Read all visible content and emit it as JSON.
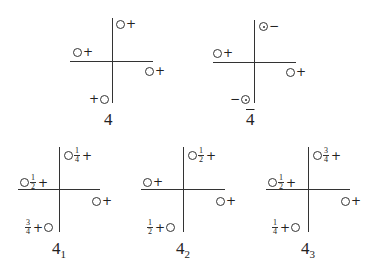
{
  "figure": {
    "panels": [
      {
        "id": "4",
        "label": "4",
        "label_sub": "",
        "overbar": false,
        "marks": [
          {
            "quadrant": "upper-right",
            "circle": "open",
            "sign": "+",
            "fraction": "",
            "order": "circle-first"
          },
          {
            "quadrant": "upper-left",
            "circle": "open",
            "sign": "+",
            "fraction": "",
            "order": "circle-first"
          },
          {
            "quadrant": "lower-right",
            "circle": "open",
            "sign": "+",
            "fraction": "",
            "order": "circle-first"
          },
          {
            "quadrant": "lower-left",
            "circle": "open",
            "sign": "+",
            "fraction": "",
            "order": "sign-first"
          }
        ]
      },
      {
        "id": "4bar",
        "label": "4",
        "label_sub": "",
        "overbar": true,
        "marks": [
          {
            "quadrant": "upper-right",
            "circle": "dotted",
            "sign": "−",
            "fraction": "",
            "order": "circle-first"
          },
          {
            "quadrant": "upper-left",
            "circle": "open",
            "sign": "+",
            "fraction": "",
            "order": "circle-first"
          },
          {
            "quadrant": "lower-right",
            "circle": "open",
            "sign": "+",
            "fraction": "",
            "order": "circle-first"
          },
          {
            "quadrant": "lower-left",
            "circle": "dotted",
            "sign": "−",
            "fraction": "",
            "order": "sign-first"
          }
        ]
      },
      {
        "id": "4_1",
        "label": "4",
        "label_sub": "1",
        "overbar": false,
        "marks": [
          {
            "quadrant": "upper-right",
            "circle": "open",
            "sign": "+",
            "fraction": {
              "num": "1",
              "den": "4"
            },
            "order": "circle-first"
          },
          {
            "quadrant": "upper-left",
            "circle": "open",
            "sign": "+",
            "fraction": {
              "num": "1",
              "den": "2"
            },
            "order": "circle-first"
          },
          {
            "quadrant": "lower-right",
            "circle": "open",
            "sign": "+",
            "fraction": "",
            "order": "circle-first"
          },
          {
            "quadrant": "lower-left",
            "circle": "open",
            "sign": "+",
            "fraction": {
              "num": "3",
              "den": "4"
            },
            "order": "sign-first"
          }
        ]
      },
      {
        "id": "4_2",
        "label": "4",
        "label_sub": "2",
        "overbar": false,
        "marks": [
          {
            "quadrant": "upper-right",
            "circle": "open",
            "sign": "+",
            "fraction": {
              "num": "1",
              "den": "2"
            },
            "order": "circle-first"
          },
          {
            "quadrant": "upper-left",
            "circle": "open",
            "sign": "+",
            "fraction": "",
            "order": "circle-first"
          },
          {
            "quadrant": "lower-right",
            "circle": "open",
            "sign": "+",
            "fraction": "",
            "order": "circle-first"
          },
          {
            "quadrant": "lower-left",
            "circle": "open",
            "sign": "+",
            "fraction": {
              "num": "1",
              "den": "2"
            },
            "order": "sign-first"
          }
        ]
      },
      {
        "id": "4_3",
        "label": "4",
        "label_sub": "3",
        "overbar": false,
        "marks": [
          {
            "quadrant": "upper-right",
            "circle": "open",
            "sign": "+",
            "fraction": {
              "num": "3",
              "den": "4"
            },
            "order": "circle-first"
          },
          {
            "quadrant": "upper-left",
            "circle": "open",
            "sign": "+",
            "fraction": {
              "num": "1",
              "den": "2"
            },
            "order": "circle-first"
          },
          {
            "quadrant": "lower-right",
            "circle": "open",
            "sign": "+",
            "fraction": "",
            "order": "circle-first"
          },
          {
            "quadrant": "lower-left",
            "circle": "open",
            "sign": "+",
            "fraction": {
              "num": "1",
              "den": "4"
            },
            "order": "sign-first"
          }
        ]
      }
    ]
  }
}
